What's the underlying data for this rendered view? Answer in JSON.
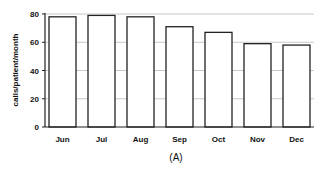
{
  "chart_data": {
    "type": "bar",
    "title": "",
    "caption": "(A)",
    "xlabel": "",
    "ylabel": "calls/patient/month",
    "categories": [
      "Jun",
      "Jul",
      "Aug",
      "Sep",
      "Oct",
      "Nov",
      "Dec"
    ],
    "values": [
      78,
      79,
      78,
      71,
      67,
      59,
      58
    ],
    "ylim": [
      0,
      80
    ],
    "yticks": [
      0,
      20,
      40,
      60,
      80
    ],
    "grid": true,
    "legend": null,
    "colors": {
      "bar_fill": "#ffffff",
      "bar_stroke": "#222222",
      "grid": "#c8c8c8",
      "axis": "#222222"
    }
  }
}
